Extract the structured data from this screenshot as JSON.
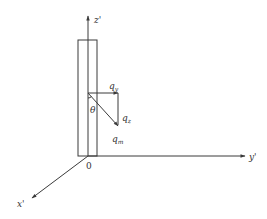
{
  "diagram": {
    "type": "force-vector-diagram",
    "axes": {
      "z": {
        "label": "z'"
      },
      "y": {
        "label": "y'"
      },
      "x": {
        "label": "x'"
      },
      "origin": {
        "label": "0"
      }
    },
    "vectors": {
      "horizontal": {
        "base": "q",
        "subscript": "y"
      },
      "vertical": {
        "base": "q",
        "subscript": "z"
      },
      "resultant": {
        "base": "q",
        "subscript": "m"
      }
    },
    "angle": {
      "label": "θ"
    },
    "colors": {
      "stroke": "#3a3a3a",
      "text": "#333333",
      "background": "#ffffff"
    }
  }
}
